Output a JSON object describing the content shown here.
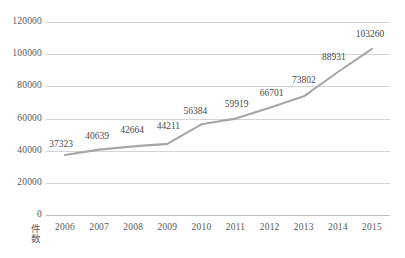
{
  "chart_data": {
    "type": "line",
    "title": "",
    "subtitle": "",
    "xlabel": "",
    "ylabel": "件数",
    "categories": [
      "2006",
      "2007",
      "2008",
      "2009",
      "2010",
      "2011",
      "2012",
      "2013",
      "2014",
      "2015"
    ],
    "values": [
      37323,
      40639,
      42664,
      44211,
      56384,
      59919,
      66701,
      73802,
      88931,
      103260
    ],
    "data_labels": [
      "37323",
      "40639",
      "42664",
      "44211",
      "56384",
      "59919",
      "66701",
      "73802",
      "88931",
      "103260"
    ],
    "ylim": [
      0,
      120000
    ],
    "yticks": [
      0,
      20000,
      40000,
      60000,
      80000,
      100000,
      120000
    ],
    "ytick_labels": [
      "0",
      "20000",
      "40000",
      "60000",
      "80000",
      "100000",
      "120000"
    ],
    "grid": true,
    "legend": false,
    "series": [
      {
        "name": "件数",
        "color": "#a6a6a6",
        "values": [
          37323,
          40639,
          42664,
          44211,
          56384,
          59919,
          66701,
          73802,
          88931,
          103260
        ]
      }
    ],
    "colors": {
      "line": "#a6a6a6",
      "grid": "#d4d4d4",
      "text": "#58595b",
      "label_text": "#4a4a4a",
      "background": "#ffffff"
    }
  }
}
